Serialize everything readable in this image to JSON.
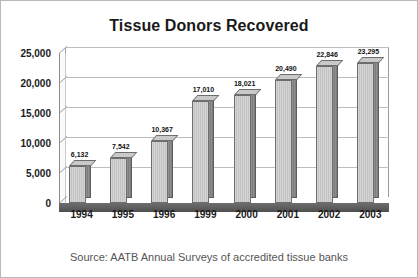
{
  "chart_data": {
    "type": "bar",
    "title": "Tissue Donors Recovered",
    "xlabel": "",
    "ylabel": "",
    "ylim": [
      0,
      25000
    ],
    "yticks": [
      "0",
      "5,000",
      "10,000",
      "15,000",
      "20,000",
      "25,000"
    ],
    "ytick_values": [
      0,
      5000,
      10000,
      15000,
      20000,
      25000
    ],
    "grid": true,
    "legend": "none",
    "categories": [
      "1994",
      "1995",
      "1996",
      "1999",
      "2000",
      "2001",
      "2002",
      "2003"
    ],
    "values": [
      6132,
      7542,
      10367,
      17010,
      18021,
      20490,
      22846,
      23295
    ],
    "data_labels": [
      "6,132",
      "7,542",
      "10,367",
      "17,010",
      "18,021",
      "20,490",
      "22,846",
      "23,295"
    ],
    "series": [
      {
        "name": "Tissue Donors Recovered",
        "values": [
          6132,
          7542,
          10367,
          17010,
          18021,
          20490,
          22846,
          23295
        ]
      }
    ],
    "style": "3d-column",
    "bar_color": "#c8c8c8",
    "bar_side_color": "#858585",
    "floor_color": "#5c5c5c",
    "grid_color": "#bdbdbd",
    "text_color": "#1a1a1a"
  },
  "caption": {
    "source": "Source: AATB Annual Surveys of accredited tissue banks"
  }
}
